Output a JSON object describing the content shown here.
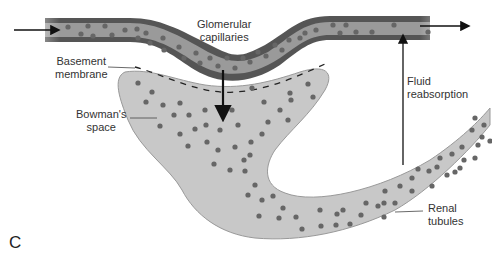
{
  "labels": {
    "glomerular_capillaries": [
      "Glomerular",
      "capillaries"
    ],
    "basement_membrane": [
      "Basement",
      "membrane"
    ],
    "bowmans_space": [
      "Bowman's",
      "space"
    ],
    "fluid_reabsorption": [
      "Fluid",
      "reabsorption"
    ],
    "renal_tubules": [
      "Renal",
      "tubules"
    ],
    "panel": "C"
  },
  "colors": {
    "capillary_wall": "#555555",
    "capillary_lumen": "#9a9a9a",
    "fluid_space": "#c8c8c8",
    "particle": "#666666"
  }
}
